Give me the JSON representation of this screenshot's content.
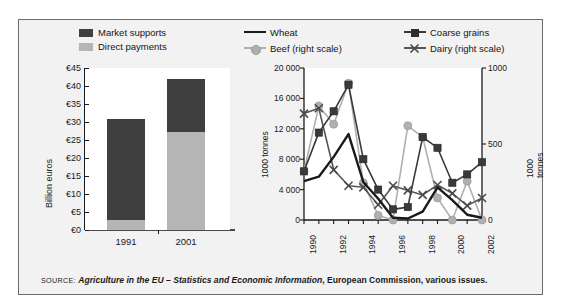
{
  "figure": {
    "background": "#f2f2f2",
    "border_color": "#6b6b6b"
  },
  "colors": {
    "market_supports": "#3f3f3f",
    "direct_payments": "#b5b5b5",
    "wheat": "#1a1a1a",
    "coarse_grains": "#3a3a3a",
    "beef": "#b0b0b0",
    "dairy": "#565656",
    "plot_background": "#ffffff"
  },
  "bar_legend": [
    {
      "label": "Market supports",
      "color": "#3f3f3f"
    },
    {
      "label": "Direct payments",
      "color": "#b5b5b5"
    }
  ],
  "line_legend": [
    {
      "label": "Wheat",
      "marker": "line",
      "color": "#1a1a1a"
    },
    {
      "label": "Coarse grains",
      "marker": "square",
      "color": "#3a3a3a"
    },
    {
      "label": "Beef   (right scale)",
      "marker": "circle",
      "color": "#b0b0b0"
    },
    {
      "label": "Dairy   (right scale)",
      "marker": "x",
      "color": "#565656"
    }
  ],
  "source": {
    "keyword": "SOURCE:",
    "italic": "Agriculture in the EU – Statistics and Economic Information",
    "rest": ", European Commission, various issues."
  },
  "chart_data": [
    {
      "type": "bar",
      "id": "cap-spending",
      "title": "",
      "xlabel": "",
      "ylabel": "Billion euros",
      "categories": [
        "1991",
        "2001"
      ],
      "ylim": [
        0,
        45
      ],
      "yticks": [
        0,
        5,
        10,
        15,
        20,
        25,
        30,
        35,
        40,
        45
      ],
      "ytick_labels": [
        "€0",
        "€5",
        "€10",
        "€15",
        "€20",
        "€25",
        "€30",
        "€35",
        "€40",
        "€45"
      ],
      "stacked": true,
      "grid": false,
      "legend_position": "top",
      "series": [
        {
          "name": "Direct payments",
          "color": "#b5b5b5",
          "values": [
            2.8,
            27.2
          ]
        },
        {
          "name": "Market supports",
          "color": "#3f3f3f",
          "values": [
            27.9,
            14.8
          ]
        }
      ],
      "totals": [
        30.7,
        42.0
      ]
    },
    {
      "type": "line",
      "id": "eu-export-subsidised-volumes",
      "title": "",
      "xlabel": "",
      "ylabel": "1000 tonnes",
      "ylabel_right": "1000 tonnes",
      "grid": false,
      "legend_position": "top",
      "x": [
        1990,
        1991,
        1992,
        1993,
        1994,
        1995,
        1996,
        1997,
        1998,
        1999,
        2000,
        2001,
        2002
      ],
      "xtick_labels": [
        "1990",
        "1992",
        "1994",
        "1996",
        "1998",
        "2000",
        "2002"
      ],
      "xticks": [
        1990,
        1992,
        1994,
        1996,
        1998,
        2000,
        2002
      ],
      "ylim": [
        0,
        20000
      ],
      "yticks": [
        0,
        4000,
        8000,
        12000,
        16000,
        20000
      ],
      "ytick_labels": [
        "0",
        "4 000",
        "8 000",
        "12 000",
        "16 000",
        "20 000"
      ],
      "ylim_right": [
        0,
        1000
      ],
      "yticks_right": [
        0,
        500,
        1000
      ],
      "ytick_labels_right": [
        "0",
        "500",
        "1000"
      ],
      "series": [
        {
          "name": "Wheat",
          "axis": "left",
          "marker": "none",
          "color": "#1a1a1a",
          "values": [
            5100,
            5700,
            8300,
            11300,
            5000,
            2800,
            300,
            200,
            1100,
            4300,
            2600,
            700,
            300
          ]
        },
        {
          "name": "Coarse grains",
          "axis": "left",
          "marker": "square",
          "color": "#3a3a3a",
          "values": [
            6400,
            11500,
            14300,
            17800,
            8000,
            4000,
            1400,
            1700,
            10900,
            9500,
            4900,
            6000,
            7600
          ]
        },
        {
          "name": "Beef",
          "axis": "right",
          "marker": "circle",
          "color": "#b0b0b0",
          "values": [
            320,
            750,
            630,
            900,
            245,
            30,
            0,
            620,
            545,
            145,
            0,
            255,
            0
          ]
        },
        {
          "name": "Dairy",
          "axis": "right",
          "marker": "x",
          "color": "#565656",
          "values": [
            700,
            735,
            330,
            225,
            215,
            100,
            225,
            195,
            165,
            230,
            175,
            95,
            145
          ]
        }
      ]
    }
  ]
}
